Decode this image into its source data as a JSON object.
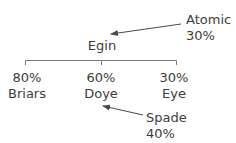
{
  "diagram": {
    "type": "ownership-tree",
    "parent": {
      "name": "Egin"
    },
    "children": [
      {
        "name": "Briars",
        "percent": "80%"
      },
      {
        "name": "Doye",
        "percent": "60%"
      },
      {
        "name": "Eye",
        "percent": "30%"
      }
    ],
    "annotations": [
      {
        "name": "Atomic",
        "percent": "30%",
        "points_to": "Egin"
      },
      {
        "name": "Spade",
        "percent": "40%",
        "points_to": "Doye"
      }
    ],
    "colors": {
      "line": "#6a6a6a",
      "text": "#3c3c3c",
      "background": "#ffffff"
    }
  }
}
